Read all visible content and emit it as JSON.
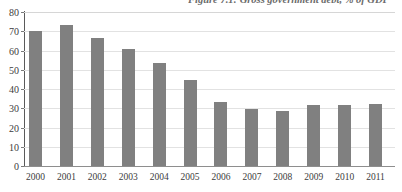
{
  "chart_data": {
    "type": "bar",
    "title": "Figure 7.1: Gross government debt, % of GDP",
    "xlabel": "",
    "ylabel": "",
    "ylim": [
      0,
      80
    ],
    "yticks": [
      0,
      10,
      20,
      30,
      40,
      50,
      60,
      70,
      80
    ],
    "grid": true,
    "legend": null,
    "categories": [
      "2000",
      "2001",
      "2002",
      "2003",
      "2004",
      "2005",
      "2006",
      "2007",
      "2008",
      "2009",
      "2010",
      "2011"
    ],
    "values": [
      70,
      73.5,
      66.5,
      61,
      53.5,
      44.5,
      33.5,
      29.5,
      28.5,
      31.5,
      31.5,
      32
    ],
    "series": [
      {
        "name": "Gross government debt",
        "values": [
          70,
          73.5,
          66.5,
          61,
          53.5,
          44.5,
          33.5,
          29.5,
          28.5,
          31.5,
          31.5,
          32
        ]
      }
    ],
    "colors": {
      "bar": "#808080",
      "gridline": "#e2e2e2",
      "axis": "#5a5a5a",
      "text": "#3c3c3c",
      "title": "#6b6b6b",
      "background": "#ffffff"
    }
  }
}
